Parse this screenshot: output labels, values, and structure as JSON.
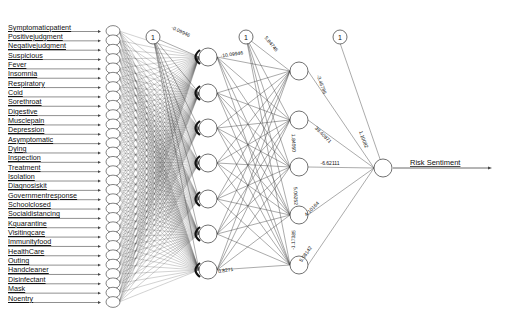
{
  "diagram": {
    "type": "neural-network",
    "inputs": [
      "Symptomaticpatient",
      "Positivejudgment",
      "Negativejudgment",
      "Suspicious",
      "Fever",
      "Insomnia",
      "Respiratory",
      "Cold",
      "Sorethroat",
      "Digestive",
      "Musclepain",
      "Depression",
      "Asymptomatic",
      "Dying",
      "Inspection",
      "Treatment",
      "Isolation",
      "Diagnosiskit",
      "Governmentresponse",
      "Schoolclosed",
      "Socialdistancing",
      "Kquarantine",
      "Visitingcare",
      "Immunityfood",
      "HealthCare",
      "Outing",
      "Handcleaner",
      "Disinfectant",
      "Mask",
      "Noentry"
    ],
    "hidden_layers": [
      7,
      5
    ],
    "output": "Risk Sentiment",
    "bias_label": "1",
    "weight_labels": {
      "bias1_top": "-0.09946",
      "h1_top": "-10.09946",
      "bias2_top": "5.84746",
      "h2_1_out": "-3.46786",
      "h2_2_out": "39.40871",
      "h2_3_out": "-6.62111",
      "h2_4_out": "4.10164",
      "h2_5_out": "5.08142",
      "bias3_out": "1.10082",
      "h2_vert_2": "1.84050",
      "h2_vert_3": "5.06252",
      "h2_vert_4": "-1.17385",
      "h1_bottom": "0.8271"
    },
    "colors": {
      "line": "#444444",
      "node_stroke": "#333333",
      "node_fill": "#ffffff",
      "text": "#111111"
    }
  }
}
